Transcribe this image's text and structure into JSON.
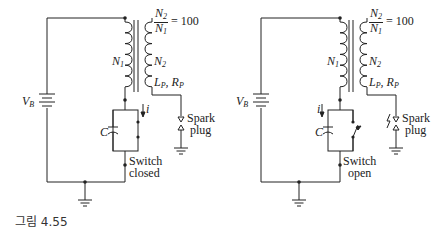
{
  "figure": {
    "caption": "그림 4.55",
    "circuits": [
      {
        "id": "switch-closed",
        "battery_label": "V",
        "battery_sub": "B",
        "ratio_num": "N",
        "ratio_num_sub": "2",
        "ratio_den": "N",
        "ratio_den_sub": "1",
        "ratio_value": "= 100",
        "primary_label": "N",
        "primary_sub": "1",
        "secondary_label": "N",
        "secondary_sub": "2",
        "lr_label": "L",
        "lr_l_sub": "P",
        "lr_r": "R",
        "lr_r_sub": "P",
        "current_label": "i",
        "capacitor_label": "C",
        "spark_label_1": "Spark",
        "spark_label_2": "plug",
        "switch_label_1": "Switch",
        "switch_label_2": "closed"
      },
      {
        "id": "switch-open",
        "battery_label": "V",
        "battery_sub": "B",
        "ratio_num": "N",
        "ratio_num_sub": "2",
        "ratio_den": "N",
        "ratio_den_sub": "1",
        "ratio_value": "= 100",
        "primary_label": "N",
        "primary_sub": "1",
        "secondary_label": "N",
        "secondary_sub": "2",
        "lr_label": "L",
        "lr_l_sub": "P",
        "lr_r": "R",
        "lr_r_sub": "P",
        "current_label": "i",
        "capacitor_label": "C",
        "spark_label_1": "Spark",
        "spark_label_2": "plug",
        "switch_label_1": "Switch",
        "switch_label_2": "open"
      }
    ]
  }
}
